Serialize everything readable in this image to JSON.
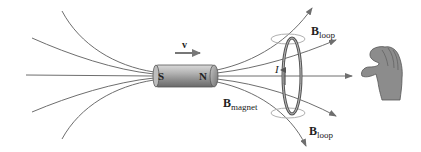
{
  "figure": {
    "magnet": {
      "south_label": "S",
      "north_label": "N",
      "body_color": "#9a9a9a"
    },
    "velocity": {
      "label": "v"
    },
    "current": {
      "label": "I"
    },
    "labels": {
      "b_magnet": {
        "symbol": "B",
        "subscript": "magnet"
      },
      "b_loop_top": {
        "symbol": "B",
        "subscript": "loop"
      },
      "b_loop_bottom": {
        "symbol": "B",
        "subscript": "loop"
      }
    },
    "colors": {
      "field_line": "#6e6e6e",
      "loop": "#555555",
      "loop_field": "#b0b0b0",
      "hand": "#8c8c8c",
      "arrow": "#777777"
    }
  }
}
